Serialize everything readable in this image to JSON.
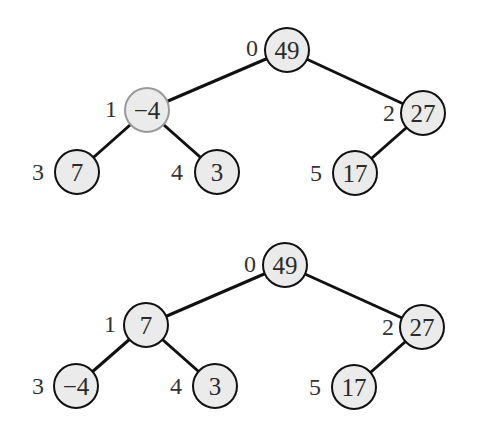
{
  "colors": {
    "node_fill": "#ebebeb",
    "node_border": "#111111",
    "highlight_border": "#9a9a9a",
    "edge": "#111111",
    "text": "#2a2a2a"
  },
  "trees": [
    {
      "name": "before",
      "nodes": [
        {
          "index": "0",
          "value": "49",
          "highlight": false
        },
        {
          "index": "1",
          "value": "−4",
          "highlight": true
        },
        {
          "index": "2",
          "value": "27",
          "highlight": false
        },
        {
          "index": "3",
          "value": "7",
          "highlight": false
        },
        {
          "index": "4",
          "value": "3",
          "highlight": false
        },
        {
          "index": "5",
          "value": "17",
          "highlight": false
        }
      ],
      "edges": [
        [
          "0",
          "1"
        ],
        [
          "0",
          "2"
        ],
        [
          "1",
          "3"
        ],
        [
          "1",
          "4"
        ],
        [
          "2",
          "5"
        ]
      ]
    },
    {
      "name": "after",
      "nodes": [
        {
          "index": "0",
          "value": "49",
          "highlight": false
        },
        {
          "index": "1",
          "value": "7",
          "highlight": false
        },
        {
          "index": "2",
          "value": "27",
          "highlight": false
        },
        {
          "index": "3",
          "value": "−4",
          "highlight": false
        },
        {
          "index": "4",
          "value": "3",
          "highlight": false
        },
        {
          "index": "5",
          "value": "17",
          "highlight": false
        }
      ],
      "edges": [
        [
          "0",
          "1"
        ],
        [
          "0",
          "2"
        ],
        [
          "1",
          "3"
        ],
        [
          "1",
          "4"
        ],
        [
          "2",
          "5"
        ]
      ]
    }
  ]
}
